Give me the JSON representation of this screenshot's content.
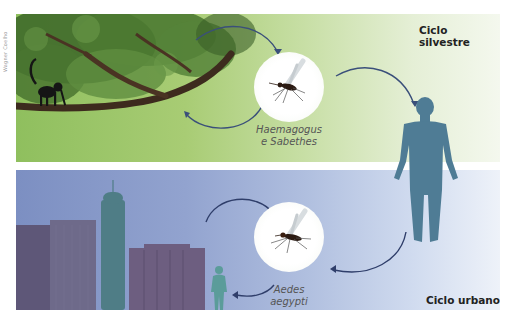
{
  "credit": "Wagner Coelho",
  "diagram": {
    "title_implied": "Ciclos de transmissão",
    "sylvatic": {
      "label": "Ciclo silvestre",
      "vector_line1": "Haemagogus",
      "vector_line2": "e Sabethes",
      "host": "monkey",
      "background_color": "#a8cc74"
    },
    "urban": {
      "label": "Ciclo urbano",
      "vector_line1": "Aedes",
      "vector_line2": "aegypti",
      "host": "human",
      "background_color": "#92a3cf"
    },
    "shared_host": "human",
    "arrow_color": "#3a4f7a",
    "human_color": "#4f7c95"
  }
}
